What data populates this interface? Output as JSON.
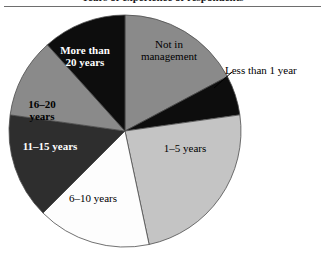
{
  "caption": {
    "text": "Years of experience of respondents"
  },
  "chart_data": {
    "type": "pie",
    "title": "",
    "subtitle": "",
    "xlabel": "",
    "ylabel": "",
    "legend_position": "none",
    "grid": false,
    "center": {
      "x": 125,
      "y": 131
    },
    "radius": 116,
    "start_angle_deg": 0,
    "direction": "clockwise",
    "outline_color": "#4d4d4d",
    "categories": [
      "Not in management",
      "Less than 1 year",
      "1–5 years",
      "6–10 years",
      "11–15 years",
      "16–20 years",
      "More than\n20 years"
    ],
    "slices": [
      {
        "label": "Not in\nmanagement",
        "label_plain": "Not in management",
        "color": "#8a8a8a",
        "start_deg": 0,
        "end_deg": 62,
        "sweep_deg": 62,
        "percent": 17.2,
        "label_color": "#000000",
        "label_placement": "inside",
        "label_bold": false
      },
      {
        "label": "Less than 1 year",
        "label_plain": "Less than 1 year",
        "color": "#0d0d0d",
        "start_deg": 62,
        "end_deg": 82,
        "sweep_deg": 20,
        "percent": 5.6,
        "label_color": "#000000",
        "label_placement": "outside",
        "label_bold": false,
        "leader_line": {
          "x1": 214,
          "y1": 88,
          "x2": 232,
          "y2": 72
        }
      },
      {
        "label": "1–5 years",
        "label_plain": "1-5 years",
        "color": "#c4c4c4",
        "start_deg": 82,
        "end_deg": 168,
        "sweep_deg": 86,
        "percent": 23.9,
        "label_color": "#000000",
        "label_placement": "inside",
        "label_bold": false
      },
      {
        "label": "6–10 years",
        "label_plain": "6-10 years",
        "color": "#fdfdfd",
        "start_deg": 168,
        "end_deg": 225,
        "sweep_deg": 57,
        "percent": 15.8,
        "label_color": "#000000",
        "label_placement": "inside",
        "label_bold": false
      },
      {
        "label": "11–15 years",
        "label_plain": "11-15 years",
        "color": "#2e2e2e",
        "start_deg": 225,
        "end_deg": 278,
        "sweep_deg": 53,
        "percent": 14.7,
        "label_color": "#ffffff",
        "label_placement": "inside",
        "label_bold": true
      },
      {
        "label": "16–20\nyears",
        "label_plain": "16-20 years",
        "color": "#8a8a8a",
        "start_deg": 278,
        "end_deg": 318,
        "sweep_deg": 40,
        "percent": 11.1,
        "label_color": "#000000",
        "label_placement": "inside",
        "label_bold": true
      },
      {
        "label": "More than\n20 years",
        "label_plain": "More than 20 years",
        "color": "#0d0d0d",
        "start_deg": 318,
        "end_deg": 360,
        "sweep_deg": 42,
        "percent": 11.7,
        "label_color": "#ffffff",
        "label_placement": "inside",
        "label_bold": true
      }
    ],
    "values": [
      17.2,
      5.6,
      23.9,
      15.8,
      14.7,
      11.1,
      11.7
    ]
  }
}
